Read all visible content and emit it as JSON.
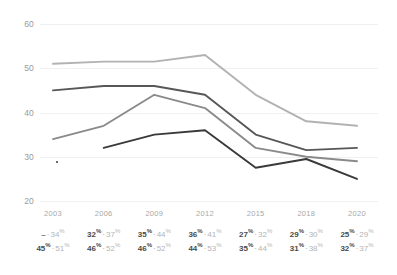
{
  "chart_data": {
    "type": "line",
    "title": "",
    "xlabel": "",
    "ylabel": "",
    "categories": [
      "2003",
      "2006",
      "2009",
      "2012",
      "2015",
      "2018",
      "2020"
    ],
    "ylim": [
      20,
      60
    ],
    "yticks": [
      "20",
      "30",
      "40",
      "50",
      "60"
    ],
    "grid": true,
    "legend": "none",
    "series": [
      {
        "name": "series-light",
        "color": "#b2b2b2",
        "values": [
          51,
          51.5,
          51.5,
          53,
          44,
          38,
          37
        ]
      },
      {
        "name": "series-dark",
        "color": "#575757",
        "values": [
          45,
          46,
          46,
          44,
          35,
          31.5,
          32
        ]
      },
      {
        "name": "series-medium",
        "color": "#8a8a8a",
        "values": [
          34,
          37,
          44,
          41,
          32,
          30,
          29
        ]
      },
      {
        "name": "series-darkest",
        "color": "#3a3a3a",
        "values": [
          null,
          32,
          35,
          36,
          27.5,
          29.5,
          25
        ]
      }
    ],
    "table": {
      "rows": [
        {
          "name": "row-upper",
          "cells": [
            {
              "primary": "–",
              "primary_pct": false,
              "secondary": "34",
              "secondary_pct": true
            },
            {
              "primary": "32",
              "primary_pct": true,
              "secondary": "37",
              "secondary_pct": true
            },
            {
              "primary": "35",
              "primary_pct": true,
              "secondary": "44",
              "secondary_pct": true
            },
            {
              "primary": "36",
              "primary_pct": true,
              "secondary": "41",
              "secondary_pct": true
            },
            {
              "primary": "27",
              "primary_pct": true,
              "secondary": "32",
              "secondary_pct": true
            },
            {
              "primary": "29",
              "primary_pct": true,
              "secondary": "30",
              "secondary_pct": true
            },
            {
              "primary": "25",
              "primary_pct": true,
              "secondary": "29",
              "secondary_pct": true
            }
          ]
        },
        {
          "name": "row-lower",
          "cells": [
            {
              "primary": "45",
              "primary_pct": true,
              "secondary": "51",
              "secondary_pct": true
            },
            {
              "primary": "46",
              "primary_pct": true,
              "secondary": "52",
              "secondary_pct": true
            },
            {
              "primary": "46",
              "primary_pct": true,
              "secondary": "52",
              "secondary_pct": true
            },
            {
              "primary": "44",
              "primary_pct": true,
              "secondary": "53",
              "secondary_pct": true
            },
            {
              "primary": "35",
              "primary_pct": true,
              "secondary": "44",
              "secondary_pct": true
            },
            {
              "primary": "31",
              "primary_pct": true,
              "secondary": "38",
              "secondary_pct": true
            },
            {
              "primary": "32",
              "primary_pct": true,
              "secondary": "37",
              "secondary_pct": true
            }
          ]
        }
      ],
      "separator": "·",
      "percent_glyph": "%"
    }
  },
  "colors": {
    "grid": "#f0f0f0",
    "axis_text": "#a0a0a0",
    "table_primary": "#4a4a4a",
    "table_secondary": "#b4b4b4",
    "background": "#ffffff"
  }
}
